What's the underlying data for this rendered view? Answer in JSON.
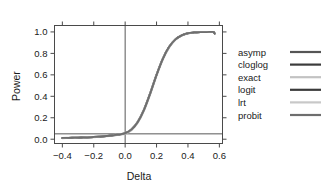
{
  "chart_data": {
    "type": "line",
    "title": "",
    "xlabel": "Delta",
    "ylabel": "Power",
    "xlim": [
      -0.45,
      0.62
    ],
    "ylim": [
      -0.04,
      1.06
    ],
    "xticks": [
      "-0.4",
      "-0.2",
      "0.0",
      "0.2",
      "0.4",
      "0.6"
    ],
    "xtick_values": [
      -0.4,
      -0.2,
      0.0,
      0.2,
      0.4,
      0.6
    ],
    "yticks": [
      "0.0",
      "0.2",
      "0.4",
      "0.6",
      "0.8",
      "1.0"
    ],
    "ytick_values": [
      0.0,
      0.2,
      0.4,
      0.6,
      0.8,
      1.0
    ],
    "grid": false,
    "legend_position": "right",
    "reference_lines": [
      {
        "name": "alpha-level",
        "orientation": "horizontal",
        "y": 0.05,
        "color": "#444444"
      },
      {
        "name": "null-delta",
        "orientation": "vertical",
        "x": 0.0,
        "color": "#444444"
      }
    ],
    "x": [
      -0.4,
      -0.36,
      -0.32,
      -0.28,
      -0.24,
      -0.2,
      -0.16,
      -0.12,
      -0.08,
      -0.04,
      0.0,
      0.04,
      0.08,
      0.12,
      0.16,
      0.2,
      0.24,
      0.28,
      0.32,
      0.36,
      0.4,
      0.44,
      0.48,
      0.52,
      0.56,
      0.57
    ],
    "series": [
      {
        "name": "asymp",
        "color": "#555555",
        "values": [
          0.012,
          0.013,
          0.014,
          0.016,
          0.018,
          0.021,
          0.025,
          0.03,
          0.036,
          0.044,
          0.055,
          0.09,
          0.16,
          0.275,
          0.43,
          0.6,
          0.75,
          0.86,
          0.93,
          0.968,
          0.987,
          0.995,
          0.998,
          0.999,
          1.0,
          0.985
        ]
      },
      {
        "name": "cloglog",
        "color": "#3b3b3b",
        "values": [
          0.011,
          0.012,
          0.013,
          0.015,
          0.017,
          0.02,
          0.024,
          0.029,
          0.035,
          0.043,
          0.053,
          0.088,
          0.157,
          0.272,
          0.427,
          0.598,
          0.748,
          0.859,
          0.929,
          0.967,
          0.987,
          0.995,
          0.998,
          0.999,
          1.0,
          0.985
        ]
      },
      {
        "name": "exact",
        "color": "#c2c2c2",
        "values": [
          0.009,
          0.01,
          0.011,
          0.013,
          0.015,
          0.018,
          0.022,
          0.026,
          0.032,
          0.04,
          0.05,
          0.083,
          0.15,
          0.263,
          0.417,
          0.588,
          0.74,
          0.853,
          0.926,
          0.965,
          0.986,
          0.994,
          0.998,
          0.999,
          1.0,
          0.985
        ]
      },
      {
        "name": "logit",
        "color": "#3b3b3b",
        "values": [
          0.012,
          0.013,
          0.014,
          0.016,
          0.018,
          0.021,
          0.025,
          0.03,
          0.036,
          0.045,
          0.056,
          0.091,
          0.162,
          0.277,
          0.432,
          0.602,
          0.752,
          0.861,
          0.931,
          0.969,
          0.988,
          0.995,
          0.998,
          0.999,
          1.0,
          0.985
        ]
      },
      {
        "name": "lrt",
        "color": "#c8c8c8",
        "values": [
          0.013,
          0.014,
          0.015,
          0.017,
          0.019,
          0.022,
          0.026,
          0.031,
          0.038,
          0.047,
          0.058,
          0.094,
          0.166,
          0.282,
          0.437,
          0.606,
          0.755,
          0.863,
          0.932,
          0.969,
          0.988,
          0.995,
          0.998,
          0.999,
          1.0,
          0.985
        ]
      },
      {
        "name": "probit",
        "color": "#6e6e6e",
        "values": [
          0.012,
          0.013,
          0.014,
          0.016,
          0.018,
          0.021,
          0.025,
          0.03,
          0.037,
          0.045,
          0.056,
          0.091,
          0.161,
          0.276,
          0.431,
          0.601,
          0.751,
          0.861,
          0.93,
          0.968,
          0.988,
          0.995,
          0.998,
          0.999,
          1.0,
          0.985
        ]
      }
    ]
  },
  "legend": {
    "entries": [
      {
        "label": "asymp",
        "color": "#555555"
      },
      {
        "label": "cloglog",
        "color": "#3b3b3b"
      },
      {
        "label": "exact",
        "color": "#c2c2c2"
      },
      {
        "label": "logit",
        "color": "#3b3b3b"
      },
      {
        "label": "lrt",
        "color": "#c8c8c8"
      },
      {
        "label": "probit",
        "color": "#6e6e6e"
      }
    ]
  },
  "axes": {
    "frame_color": "#4a4a4a",
    "background": "#ffffff"
  }
}
